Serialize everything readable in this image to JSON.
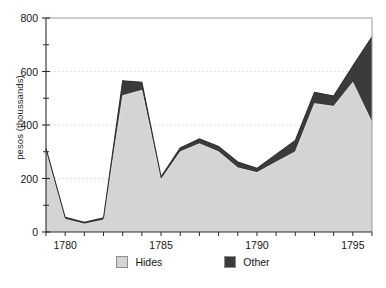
{
  "chart_data": {
    "type": "area",
    "stacked": true,
    "title": "",
    "xlabel": "",
    "ylabel": "pesos (thoussands)",
    "xlim": [
      1779,
      1796
    ],
    "ylim": [
      0,
      800
    ],
    "grid": true,
    "grid_axis": "y",
    "gridlines": [
      200,
      400,
      600
    ],
    "legend_position": "bottom",
    "y_major_ticks": [
      0,
      200,
      400,
      600,
      800
    ],
    "y_minor_ticks": [
      100,
      300,
      500,
      700
    ],
    "y_tick_labels": [
      "0",
      "200",
      "400",
      "600",
      "800"
    ],
    "x_ticks": [
      1779,
      1780,
      1781,
      1782,
      1783,
      1784,
      1785,
      1786,
      1787,
      1788,
      1789,
      1790,
      1791,
      1792,
      1793,
      1794,
      1795,
      1796
    ],
    "x_tick_labels": [
      {
        "x": 1780,
        "label": "1780"
      },
      {
        "x": 1785,
        "label": "1785"
      },
      {
        "x": 1790,
        "label": "1790"
      },
      {
        "x": 1795,
        "label": "1795"
      }
    ],
    "x": [
      1779,
      1780,
      1781,
      1782,
      1783,
      1784,
      1785,
      1786,
      1787,
      1788,
      1789,
      1790,
      1791,
      1792,
      1793,
      1794,
      1795,
      1796
    ],
    "series": [
      {
        "name": "Hides",
        "color": "#d4d4d4",
        "values": [
          305,
          48,
          30,
          45,
          510,
          530,
          196,
          300,
          330,
          300,
          240,
          222,
          262,
          300,
          480,
          470,
          560,
          410
        ]
      },
      {
        "name": "Other",
        "color": "#3b3b3b",
        "values": [
          8,
          7,
          6,
          8,
          55,
          30,
          10,
          14,
          18,
          20,
          22,
          16,
          28,
          42,
          42,
          38,
          60,
          320
        ]
      }
    ],
    "totals": [
      313,
      55,
      36,
      53,
      565,
      560,
      206,
      314,
      348,
      320,
      262,
      238,
      290,
      342,
      522,
      508,
      620,
      730
    ]
  },
  "legend": {
    "items": [
      {
        "label": "Hides",
        "color": "#d4d4d4"
      },
      {
        "label": "Other",
        "color": "#3b3b3b"
      }
    ]
  }
}
